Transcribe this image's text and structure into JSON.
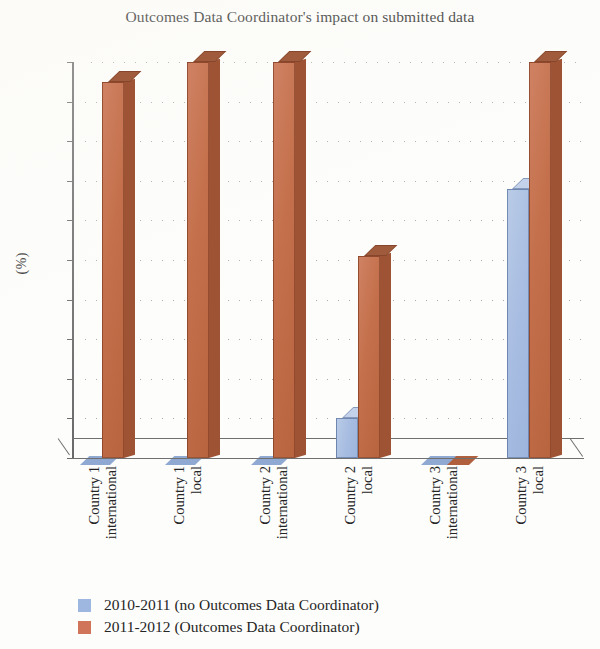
{
  "chart_data": {
    "type": "bar",
    "title": "Outcomes Data Coordinator's impact on submitted data",
    "xlabel": "",
    "ylabel": "(%)",
    "ylim": [
      0,
      100
    ],
    "ytick_step": 10,
    "yticks": [
      "100",
      "90",
      "80",
      "70",
      "60",
      "50",
      "40",
      "30",
      "20",
      "10",
      "0"
    ],
    "grid": true,
    "legend_position": "bottom-left",
    "style": "3d-column",
    "categories": [
      {
        "line1": "Country 1",
        "line2": "international"
      },
      {
        "line1": "Country 1",
        "line2": "local"
      },
      {
        "line1": "Country 2",
        "line2": "international"
      },
      {
        "line1": "Country 2",
        "line2": "local"
      },
      {
        "line1": "Country 3",
        "line2": "international"
      },
      {
        "line1": "Country 3",
        "line2": "local"
      }
    ],
    "series": [
      {
        "name": "2010-2011 (no Outcomes Data Coordinator)",
        "color": "#9db7e0",
        "values": [
          0,
          0,
          0,
          10,
          0,
          68
        ]
      },
      {
        "name": "2011-2012 (Outcomes Data Coordinator)",
        "color": "#d0755a",
        "values": [
          95,
          100,
          100,
          51,
          0,
          100
        ]
      }
    ]
  }
}
